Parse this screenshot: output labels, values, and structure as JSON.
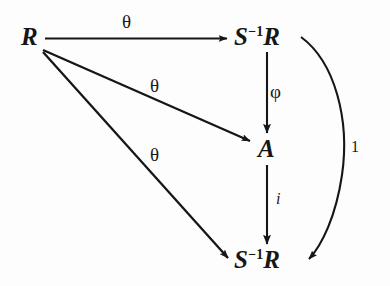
{
  "figure": {
    "kind": "commutative-diagram",
    "background_color": "#fdfdfd",
    "ink_color": "#161616"
  },
  "nodes": [
    {
      "id": "node-r",
      "name": "source-ring",
      "text": "R",
      "superscript": "",
      "x": 21,
      "y": 24
    },
    {
      "id": "node-sr-top",
      "name": "localization-top",
      "text_before": "S",
      "superscript": "−1",
      "text_after": "R",
      "x": 234,
      "y": 24
    },
    {
      "id": "node-a",
      "name": "target-algebra",
      "text": "A",
      "superscript": "",
      "x": 258,
      "y": 136
    },
    {
      "id": "node-sr-bottom",
      "name": "localization-bottom",
      "text_before": "S",
      "superscript": "−1",
      "text_after": "R",
      "x": 234,
      "y": 247
    }
  ],
  "edges": [
    {
      "id": "edge-theta-top",
      "name": "arrow-r-to-localization-top",
      "label": "θ",
      "label_x": 122,
      "label_y": 12,
      "style": "straight",
      "from": "node-r",
      "to": "node-sr-top"
    },
    {
      "id": "edge-theta-mid",
      "name": "arrow-r-to-a",
      "label": "θ",
      "label_x": 150,
      "label_y": 76,
      "style": "straight",
      "from": "node-r",
      "to": "node-a"
    },
    {
      "id": "edge-theta-bottom",
      "name": "arrow-r-to-localization-bottom",
      "label": "θ",
      "label_x": 150,
      "label_y": 145,
      "style": "straight",
      "from": "node-r",
      "to": "node-sr-bottom"
    },
    {
      "id": "edge-phi",
      "name": "arrow-localization-top-to-a",
      "label": "φ",
      "label_x": 270,
      "label_y": 82,
      "style": "straight-vertical",
      "from": "node-sr-top",
      "to": "node-a"
    },
    {
      "id": "edge-i",
      "name": "arrow-a-to-localization-bottom",
      "label": "i",
      "label_x": 276,
      "label_y": 191,
      "style": "straight-vertical",
      "from": "node-a",
      "to": "node-sr-bottom"
    },
    {
      "id": "edge-identity",
      "name": "arrow-identity-curved",
      "label": "1",
      "label_x": 351,
      "label_y": 139,
      "style": "curved",
      "from": "node-sr-top",
      "to": "node-sr-bottom"
    }
  ]
}
